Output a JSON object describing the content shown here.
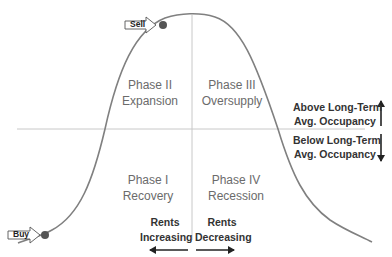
{
  "diagram": {
    "colors": {
      "curve": "#808080",
      "axis_line": "#c8c8c8",
      "dot": "#555555",
      "arrow": "#222222",
      "phase_text": "#6b6b6b"
    },
    "phases": [
      {
        "id": "phase1",
        "line1": "Phase I",
        "line2": "Recovery"
      },
      {
        "id": "phase2",
        "line1": "Phase II",
        "line2": "Expansion"
      },
      {
        "id": "phase3",
        "line1": "Phase III",
        "line2": "Oversupply"
      },
      {
        "id": "phase4",
        "line1": "Phase IV",
        "line2": "Recession"
      }
    ],
    "occupancy": {
      "above_line1": "Above Long-Term",
      "above_line2": "Avg. Occupancy",
      "below_line1": "Below Long-Term",
      "below_line2": "Avg. Occupancy"
    },
    "rents": {
      "increasing_line1": "Rents",
      "increasing_line2": "Increasing",
      "decreasing_line1": "Rents",
      "decreasing_line2": "Decreasing"
    },
    "markers": {
      "sell": "Sell",
      "buy": "Buy"
    }
  }
}
